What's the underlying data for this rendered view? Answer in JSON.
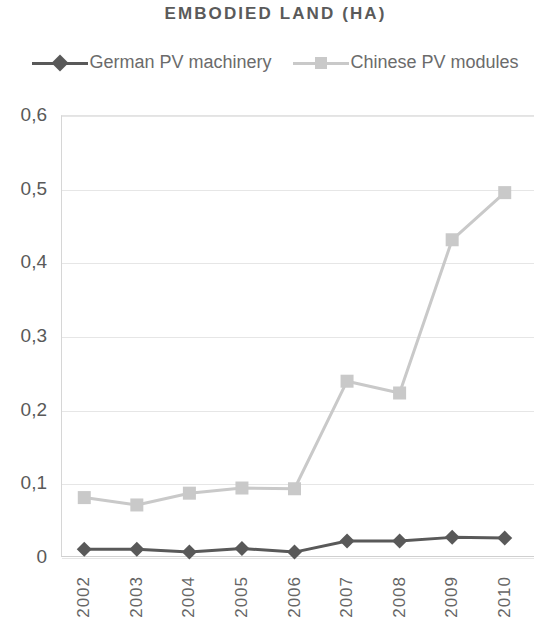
{
  "chart_data": {
    "type": "line",
    "title": "EMBODIED LAND (HA)",
    "xlabel": "",
    "ylabel": "",
    "categories": [
      "2002",
      "2003",
      "2004",
      "2005",
      "2006",
      "2007",
      "2008",
      "2009",
      "2010"
    ],
    "series": [
      {
        "name": "German PV machinery",
        "color": "#595959",
        "marker": "diamond",
        "values": [
          0.012,
          0.012,
          0.008,
          0.013,
          0.008,
          0.023,
          0.023,
          0.028,
          0.027
        ]
      },
      {
        "name": "Chinese PV modules",
        "color": "#c9c9c9",
        "marker": "square",
        "values": [
          0.082,
          0.072,
          0.088,
          0.095,
          0.094,
          0.24,
          0.224,
          0.432,
          0.496
        ]
      }
    ],
    "ylim": [
      0,
      0.6
    ],
    "yticks": [
      0,
      0.1,
      0.2,
      0.3,
      0.4,
      0.5,
      0.6
    ],
    "ytick_labels": [
      "0",
      "0,1",
      "0,2",
      "0,3",
      "0,4",
      "0,5",
      "0,6"
    ],
    "grid": true,
    "legend_position": "top",
    "decimal_separator": ","
  },
  "legend": {
    "entries": [
      {
        "label": "German PV machinery"
      },
      {
        "label": "Chinese PV modules"
      }
    ]
  }
}
